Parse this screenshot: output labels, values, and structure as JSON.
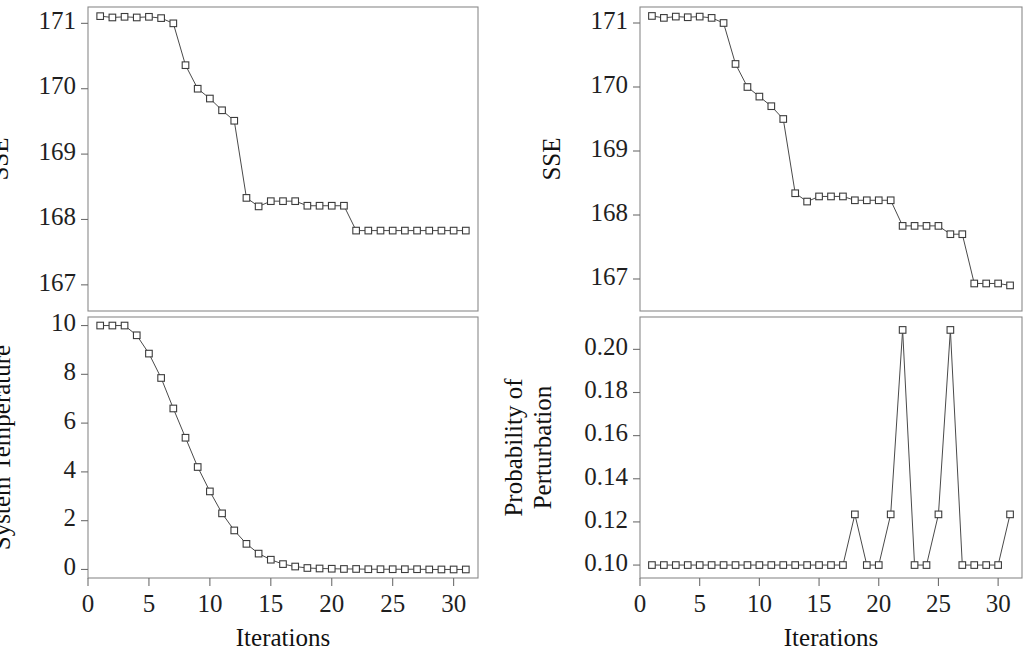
{
  "figure": {
    "width": 1023,
    "height": 649,
    "background": "#ffffff",
    "line_color": "#4a4a4a",
    "marker_edge_color": "#3c3c3c",
    "marker_face_color": "#ffffff",
    "axis_color": "#8a8a8a"
  },
  "chart_data": [
    {
      "id": "left-sse",
      "type": "line",
      "panel": "top-left",
      "title": "",
      "xlabel": "",
      "ylabel": "SSE",
      "xlim": [
        0,
        32
      ],
      "ylim": [
        166.6,
        171.25
      ],
      "xticks": [
        0,
        5,
        10,
        15,
        20,
        25,
        30
      ],
      "xticklabels": [
        "0",
        "5",
        "10",
        "15",
        "20",
        "25",
        "30"
      ],
      "yticks": [
        167,
        168,
        169,
        170,
        171
      ],
      "yticklabels": [
        "167",
        "168",
        "169",
        "170",
        "171"
      ],
      "grid": false,
      "legend": null,
      "marker": "open-square",
      "x": [
        1,
        2,
        3,
        4,
        5,
        6,
        7,
        8,
        9,
        10,
        11,
        12,
        13,
        14,
        15,
        16,
        17,
        18,
        19,
        20,
        21,
        22,
        23,
        24,
        25,
        26,
        27,
        28,
        29,
        30,
        31
      ],
      "values": [
        171.11,
        171.09,
        171.1,
        171.09,
        171.1,
        171.08,
        171.0,
        170.36,
        170.0,
        169.85,
        169.67,
        169.51,
        168.33,
        168.2,
        168.28,
        168.28,
        168.28,
        168.21,
        168.21,
        168.21,
        168.21,
        167.83,
        167.83,
        167.83,
        167.83,
        167.83,
        167.83,
        167.83,
        167.83,
        167.83,
        167.83
      ]
    },
    {
      "id": "left-temperature",
      "type": "line",
      "panel": "bottom-left",
      "title": "",
      "xlabel": "Iterations",
      "ylabel": "System Temperature",
      "xlim": [
        0,
        32
      ],
      "ylim": [
        -0.35,
        10.35
      ],
      "xticks": [
        0,
        5,
        10,
        15,
        20,
        25,
        30
      ],
      "xticklabels": [
        "0",
        "5",
        "10",
        "15",
        "20",
        "25",
        "30"
      ],
      "yticks": [
        0,
        2,
        4,
        6,
        8,
        10
      ],
      "yticklabels": [
        "0",
        "2",
        "4",
        "6",
        "8",
        "10"
      ],
      "grid": false,
      "legend": null,
      "marker": "open-square",
      "x": [
        1,
        2,
        3,
        4,
        5,
        6,
        7,
        8,
        9,
        10,
        11,
        12,
        13,
        14,
        15,
        16,
        17,
        18,
        19,
        20,
        21,
        22,
        23,
        24,
        25,
        26,
        27,
        28,
        29,
        30,
        31
      ],
      "values": [
        10.0,
        10.0,
        10.0,
        9.6,
        8.85,
        7.85,
        6.6,
        5.4,
        4.2,
        3.2,
        2.3,
        1.6,
        1.05,
        0.65,
        0.4,
        0.22,
        0.12,
        0.06,
        0.04,
        0.03,
        0.02,
        0.02,
        0.01,
        0.01,
        0.01,
        0.01,
        0.01,
        0.0,
        0.0,
        0.0,
        0.0
      ]
    },
    {
      "id": "right-sse",
      "type": "line",
      "panel": "top-right",
      "title": "",
      "xlabel": "",
      "ylabel": "SSE",
      "xlim": [
        0,
        32
      ],
      "ylim": [
        166.5,
        171.25
      ],
      "xticks": [
        0,
        5,
        10,
        15,
        20,
        25,
        30
      ],
      "xticklabels": [
        "0",
        "5",
        "10",
        "15",
        "20",
        "25",
        "30"
      ],
      "yticks": [
        167,
        168,
        169,
        170,
        171
      ],
      "yticklabels": [
        "167",
        "168",
        "169",
        "170",
        "171"
      ],
      "grid": false,
      "legend": null,
      "marker": "open-square",
      "x": [
        1,
        2,
        3,
        4,
        5,
        6,
        7,
        8,
        9,
        10,
        11,
        12,
        13,
        14,
        15,
        16,
        17,
        18,
        19,
        20,
        21,
        22,
        23,
        24,
        25,
        26,
        27,
        28,
        29,
        30,
        31
      ],
      "values": [
        171.11,
        171.08,
        171.1,
        171.09,
        171.1,
        171.08,
        171.0,
        170.36,
        170.0,
        169.85,
        169.7,
        169.5,
        168.34,
        168.21,
        168.29,
        168.29,
        168.29,
        168.23,
        168.23,
        168.23,
        168.23,
        167.83,
        167.83,
        167.83,
        167.83,
        167.7,
        167.7,
        166.93,
        166.93,
        166.93,
        166.9
      ]
    },
    {
      "id": "right-probability",
      "type": "line",
      "panel": "bottom-right",
      "title": "",
      "xlabel": "Iterations",
      "ylabel": "Probability of Perturbation",
      "xlim": [
        0,
        32
      ],
      "ylim": [
        0.094,
        0.215
      ],
      "xticks": [
        0,
        5,
        10,
        15,
        20,
        25,
        30
      ],
      "xticklabels": [
        "0",
        "5",
        "10",
        "15",
        "20",
        "25",
        "30"
      ],
      "yticks": [
        0.1,
        0.12,
        0.14,
        0.16,
        0.18,
        0.2
      ],
      "yticklabels": [
        "0.10",
        "0.12",
        "0.14",
        "0.16",
        "0.18",
        "0.20"
      ],
      "grid": false,
      "legend": null,
      "marker": "open-square",
      "x": [
        1,
        2,
        3,
        4,
        5,
        6,
        7,
        8,
        9,
        10,
        11,
        12,
        13,
        14,
        15,
        16,
        17,
        18,
        19,
        20,
        21,
        22,
        23,
        24,
        25,
        26,
        27,
        28,
        29,
        30,
        31
      ],
      "values": [
        0.1,
        0.1,
        0.1,
        0.1,
        0.1,
        0.1,
        0.1,
        0.1,
        0.1,
        0.1,
        0.1,
        0.1,
        0.1,
        0.1,
        0.1,
        0.1,
        0.1,
        0.1235,
        0.1,
        0.1,
        0.1235,
        0.209,
        0.1,
        0.1,
        0.1235,
        0.209,
        0.1,
        0.1,
        0.1,
        0.1,
        0.1235
      ]
    }
  ],
  "labels": {
    "sse": "SSE",
    "system_temperature": "System Temperature",
    "probability_of_perturbation_line1": "Probability of",
    "probability_of_perturbation_line2": "Perturbation",
    "iterations": "Iterations"
  }
}
